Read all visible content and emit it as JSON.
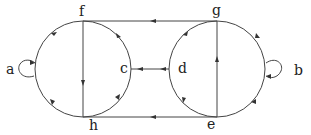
{
  "diagram": {
    "type": "state-transition-graph",
    "nodes": [
      {
        "id": "a",
        "label": "a"
      },
      {
        "id": "b",
        "label": "b"
      },
      {
        "id": "c",
        "label": "c"
      },
      {
        "id": "d",
        "label": "d"
      },
      {
        "id": "e",
        "label": "e"
      },
      {
        "id": "f",
        "label": "f"
      },
      {
        "id": "g",
        "label": "g"
      },
      {
        "id": "h",
        "label": "h"
      }
    ],
    "edges": [
      {
        "from": "g",
        "to": "f",
        "kind": "straight"
      },
      {
        "from": "e",
        "to": "h",
        "kind": "straight"
      },
      {
        "from": "d",
        "to": "c",
        "kind": "straight"
      },
      {
        "from": "f",
        "to": "h",
        "kind": "straight"
      },
      {
        "from": "e",
        "to": "g",
        "kind": "straight"
      },
      {
        "from": "a",
        "to": "a",
        "kind": "self-loop"
      },
      {
        "from": "b",
        "to": "b",
        "kind": "self-loop"
      }
    ],
    "colors": {
      "stroke": "#333333",
      "background": "#ffffff"
    }
  }
}
